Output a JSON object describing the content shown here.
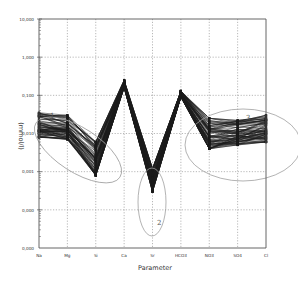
{
  "chart_data": {
    "type": "line",
    "title": "",
    "xlabel": "Parameter",
    "ylabel": "(mmol/l)",
    "yscale": "log",
    "ylim": [
      0.0001,
      10
    ],
    "grid": true,
    "legend": null,
    "categories": [
      "Na",
      "Mg",
      "Si",
      "Ca",
      "Sr",
      "HCO3",
      "NO3",
      "SO4",
      "Cl"
    ],
    "y_tick_labels": [
      "10,000",
      "1,000",
      "0,100",
      "0,010",
      "0,001",
      "0,000",
      "0,000"
    ],
    "series_description": "Many overlapping sample profiles (parallel-coordinates style) drawn as dark lines with markers",
    "envelope": {
      "max": [
        0.035,
        0.03,
        0.006,
        0.25,
        0.0012,
        0.13,
        0.025,
        0.022,
        0.03
      ],
      "median": [
        0.018,
        0.015,
        0.0025,
        0.2,
        0.0007,
        0.11,
        0.012,
        0.011,
        0.014
      ],
      "min": [
        0.008,
        0.007,
        0.0008,
        0.16,
        0.0003,
        0.09,
        0.004,
        0.005,
        0.006
      ]
    },
    "annotations": [
      {
        "label": "1",
        "shape": "ellipse",
        "covers": [
          "Na",
          "Mg",
          "Si"
        ]
      },
      {
        "label": "2",
        "shape": "ellipse",
        "covers": [
          "Sr"
        ]
      },
      {
        "label": "3",
        "shape": "ellipse",
        "covers": [
          "NO3",
          "SO4",
          "Cl"
        ]
      }
    ]
  },
  "axis": {
    "y_title": "(mmol/l)",
    "x_title": "Parameter",
    "y_ticks": [
      "10,000",
      "1,000",
      "0,100",
      "0,010",
      "0,001",
      "0,000",
      "0,000"
    ],
    "x_ticks": [
      "Na",
      "Mg",
      "Si",
      "Ca",
      "Sr",
      "HCO3",
      "NO3",
      "SO4",
      "Cl"
    ]
  },
  "annotations": {
    "cluster1": "1",
    "cluster2": "2",
    "cluster3": "3"
  },
  "colors": {
    "line": "#1a1a1a",
    "grid": "#9a9a9a",
    "axis": "#555555",
    "ellipse": "#9a9a9a"
  }
}
